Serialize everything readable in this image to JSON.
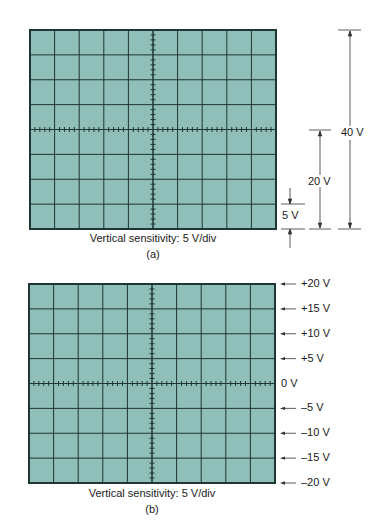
{
  "figure_a": {
    "caption": "Vertical sensitivity: 5 V/div",
    "sublabel": "(a)",
    "grid": {
      "columns": 10,
      "rows": 8,
      "minor_ticks_per_division": 5
    },
    "dimensions": [
      {
        "label": "5 V",
        "span_divisions": 1
      },
      {
        "label": "20 V",
        "span_divisions": 4
      },
      {
        "label": "40 V",
        "span_divisions": 8
      }
    ]
  },
  "figure_b": {
    "caption": "Vertical sensitivity: 5 V/div",
    "sublabel": "(b)",
    "grid": {
      "columns": 10,
      "rows": 8,
      "minor_ticks_per_division": 5
    },
    "level_labels": [
      "+20 V",
      "+15 V",
      "+10 V",
      "+5 V",
      "0 V",
      "–5 V",
      "–10 V",
      "–15 V",
      "–20 V"
    ]
  },
  "colors": {
    "screen": "#90beb9",
    "grid_line": "#1e3634",
    "annotation": "#333333"
  }
}
